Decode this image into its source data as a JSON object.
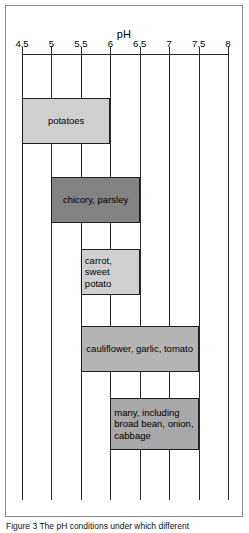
{
  "figure": {
    "axis_title": "pH",
    "caption": "Figure 3   The pH conditions under which different"
  },
  "chart_data": {
    "type": "bar",
    "orientation": "horizontal-range",
    "title": "",
    "xlabel": "pH",
    "ylabel": "",
    "xlim": [
      4.5,
      8
    ],
    "tick_labels": [
      "4.5",
      "5",
      "5.5",
      "6",
      "6.5",
      "7",
      "7.5",
      "8"
    ],
    "tick_values": [
      4.5,
      5,
      5.5,
      6,
      6.5,
      7,
      7.5,
      8
    ],
    "grid": true,
    "legend": "none",
    "bars": [
      {
        "label": "potatoes",
        "start": 4.5,
        "end": 6.0,
        "color": "#cfcfcf",
        "align": "center",
        "top_px": 92,
        "height_px": 46
      },
      {
        "label": "chicory, parsley",
        "start": 5.0,
        "end": 6.5,
        "color": "#838383",
        "align": "center",
        "top_px": 171,
        "height_px": 46
      },
      {
        "label": "carrot,\nsweet potato",
        "start": 5.5,
        "end": 6.5,
        "color": "#cfcfcf",
        "align": "left",
        "top_px": 243,
        "height_px": 46
      },
      {
        "label": "cauliflower, garlic, tomato",
        "start": 5.5,
        "end": 7.5,
        "color": "#b4b4b4",
        "align": "center",
        "top_px": 320,
        "height_px": 46
      },
      {
        "label": "many, including\nbroad bean, onion,\ncabbage",
        "start": 6.0,
        "end": 7.5,
        "color": "#a8a8a8",
        "align": "left",
        "top_px": 392,
        "height_px": 52
      }
    ]
  }
}
